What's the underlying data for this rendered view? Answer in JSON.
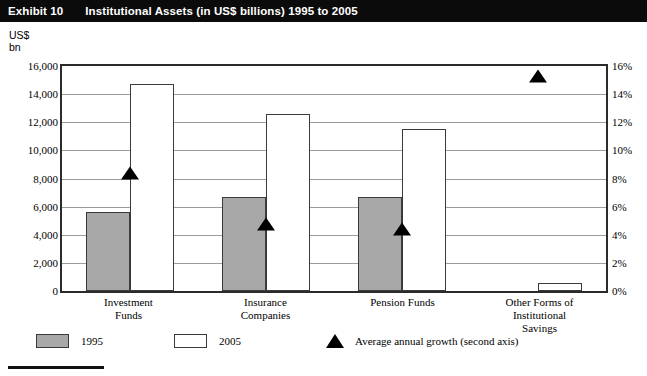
{
  "header": {
    "exhibit_label": "Exhibit 10",
    "title": "Institutional Assets (in US$ billions) 1995 to 2005"
  },
  "axes": {
    "left_caption_line1": "US$",
    "left_caption_line2": "bn",
    "left_ticks": [
      "16,000",
      "14,000",
      "12,000",
      "10,000",
      "8,000",
      "6,000",
      "4,000",
      "2,000",
      "0"
    ],
    "right_ticks": [
      "16%",
      "14%",
      "12%",
      "10%",
      "8%",
      "6%",
      "4%",
      "2%",
      "0%"
    ]
  },
  "legend": {
    "items": [
      {
        "label": "1995",
        "swatch": "gray-square-swatch"
      },
      {
        "label": "2005",
        "swatch": "white-square-swatch"
      },
      {
        "label": "Average annual growth (second axis)",
        "swatch": "black-triangle-marker"
      }
    ]
  },
  "colors": {
    "bar_1995": "#a8a8a8",
    "bar_2005": "#ffffff",
    "bar_outline": "#3a3a3a",
    "marker": "#000000",
    "grid": "#9a9a9a",
    "plot_border": "#2b2b2b",
    "title_bar_bg": "#0b0b0b",
    "title_bar_fg": "#ffffff"
  },
  "chart_data": {
    "type": "bar",
    "title": "Institutional Assets (in US$ billions) 1995 to 2005",
    "xlabel": "",
    "ylabel": "US$ bn",
    "y2label": "Average annual growth",
    "ylim": [
      0,
      16000
    ],
    "y2lim": [
      0,
      16
    ],
    "ytick_step": 2000,
    "y2tick_step": 2,
    "grid": true,
    "legend_position": "bottom",
    "categories": [
      "Investment Funds",
      "Insurance Companies",
      "Pension Funds",
      "Other Forms of Institutional Savings"
    ],
    "category_label_lines": [
      [
        "Investment",
        "Funds"
      ],
      [
        "Insurance",
        "Companies"
      ],
      [
        "Pension Funds"
      ],
      [
        "Other Forms of",
        "Institutional",
        "Savings"
      ]
    ],
    "series": [
      {
        "name": "1995",
        "axis": "left",
        "unit": "US$ bn",
        "values": [
          5600,
          6700,
          6700,
          null
        ]
      },
      {
        "name": "2005",
        "axis": "left",
        "unit": "US$ bn",
        "values": [
          14700,
          12600,
          11500,
          550
        ]
      },
      {
        "name": "Average annual growth (second axis)",
        "axis": "right",
        "unit": "%",
        "type": "marker",
        "values": [
          8.4,
          4.8,
          4.4,
          15.3
        ]
      }
    ]
  }
}
